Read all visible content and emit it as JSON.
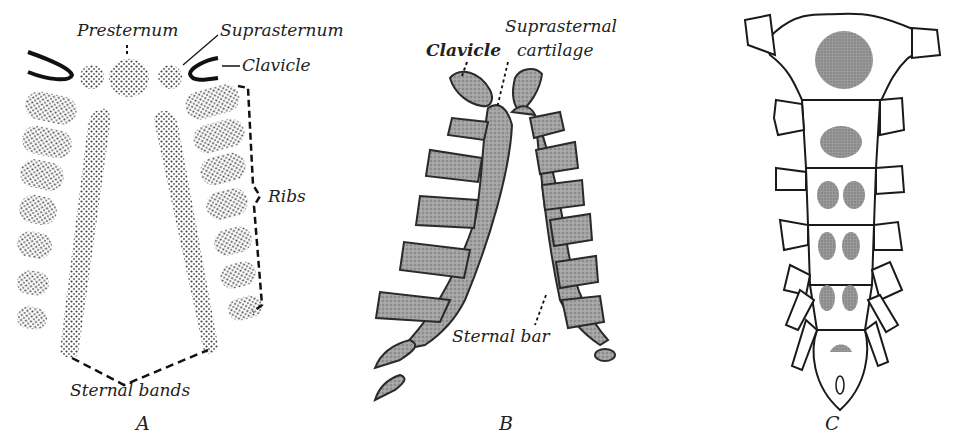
{
  "figure": {
    "panels": [
      {
        "id": "A",
        "letter": "A",
        "labels": {
          "presternum": "Presternum",
          "suprasternum": "Suprasternum",
          "clavicle": "Clavicle",
          "ribs": "Ribs",
          "sternal_bands": "Sternal bands"
        }
      },
      {
        "id": "B",
        "letter": "B",
        "labels": {
          "clavicle": "Clavicle",
          "suprasternal_cartilage_line1": "Suprasternal",
          "suprasternal_cartilage_line2": "cartilage",
          "sternal_bar": "Sternal bar"
        }
      },
      {
        "id": "C",
        "letter": "C",
        "labels": {}
      }
    ],
    "colors": {
      "ink": "#1a1a1a",
      "stipple": "#555555",
      "cartilage_fill": "#9a9a9a",
      "ossification_fill": "#8c8c8c"
    }
  }
}
